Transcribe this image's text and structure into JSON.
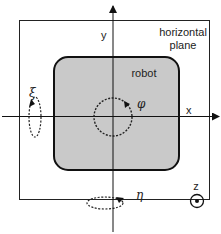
{
  "diagram": {
    "plane": {
      "label_line1": "horizontal",
      "label_line2": "plane"
    },
    "robot": {
      "label": "robot",
      "fill": "#c9c9c9"
    },
    "axes": {
      "x_label": "x",
      "y_label": "y",
      "z_label": "z"
    },
    "rotations": {
      "yaw": "φ",
      "roll": "ξ",
      "pitch": "η"
    }
  }
}
